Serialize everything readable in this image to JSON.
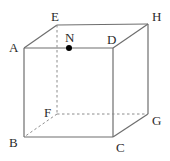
{
  "figure": {
    "kind": "geometry-diagram",
    "shape_name": "cube",
    "background_color": "#ffffff",
    "edge_color": "#6e6e6e",
    "hidden_edge_color": "#8c8c8c",
    "label_color": "#2b2b2b",
    "point_color": "#000000",
    "width": 170,
    "height": 161
  },
  "vertices": [
    {
      "id": "A",
      "label": "A",
      "x": 24,
      "y": 48,
      "label_x": 9,
      "label_y": 41,
      "hidden": false
    },
    {
      "id": "B",
      "label": "B",
      "x": 24,
      "y": 137,
      "label_x": 9,
      "label_y": 136,
      "hidden": false
    },
    {
      "id": "C",
      "label": "C",
      "x": 113,
      "y": 137,
      "label_x": 116,
      "label_y": 141,
      "hidden": false
    },
    {
      "id": "D",
      "label": "D",
      "x": 113,
      "y": 48,
      "label_x": 107,
      "label_y": 33,
      "hidden": false
    },
    {
      "id": "E",
      "label": "E",
      "x": 57,
      "y": 25,
      "label_x": 51,
      "label_y": 10,
      "hidden": false
    },
    {
      "id": "F",
      "label": "F",
      "x": 57,
      "y": 114,
      "label_x": 44,
      "label_y": 106,
      "hidden": true
    },
    {
      "id": "G",
      "label": "G",
      "x": 148,
      "y": 114,
      "label_x": 152,
      "label_y": 114,
      "hidden": false
    },
    {
      "id": "H",
      "label": "H",
      "x": 148,
      "y": 24,
      "label_x": 152,
      "label_y": 10,
      "hidden": false
    }
  ],
  "marked_points": [
    {
      "id": "N",
      "label": "N",
      "x": 69,
      "y": 48,
      "radius": 3,
      "label_x": 65,
      "label_y": 31,
      "on_edge": "A-D"
    }
  ],
  "edges": [
    {
      "id": "A-D",
      "from": "A",
      "to": "D",
      "style": "solid"
    },
    {
      "id": "A-B",
      "from": "A",
      "to": "B",
      "style": "solid"
    },
    {
      "id": "B-C",
      "from": "B",
      "to": "C",
      "style": "solid"
    },
    {
      "id": "C-D",
      "from": "C",
      "to": "D",
      "style": "solid"
    },
    {
      "id": "A-E",
      "from": "A",
      "to": "E",
      "style": "solid"
    },
    {
      "id": "D-H",
      "from": "D",
      "to": "H",
      "style": "solid"
    },
    {
      "id": "C-G",
      "from": "C",
      "to": "G",
      "style": "solid"
    },
    {
      "id": "E-H",
      "from": "E",
      "to": "H",
      "style": "solid"
    },
    {
      "id": "H-G",
      "from": "H",
      "to": "G",
      "style": "solid"
    },
    {
      "id": "E-F",
      "from": "E",
      "to": "F",
      "style": "dashed"
    },
    {
      "id": "F-G",
      "from": "F",
      "to": "G",
      "style": "dashed"
    },
    {
      "id": "F-B",
      "from": "F",
      "to": "B",
      "style": "dashed"
    }
  ]
}
